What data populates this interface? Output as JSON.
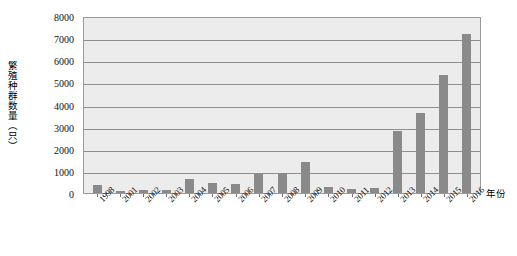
{
  "chart_data": {
    "type": "bar",
    "title": "",
    "subtitle": "",
    "xlabel": "年份",
    "ylabel": "繁殖种群数量（只）",
    "categories": [
      "1998",
      "2001",
      "2002",
      "2003",
      "2004",
      "2005",
      "2006",
      "2007",
      "2008",
      "2009",
      "2010",
      "2011",
      "2012",
      "2013",
      "2014",
      "2015",
      "2016"
    ],
    "values": [
      350,
      100,
      150,
      130,
      620,
      450,
      400,
      880,
      900,
      1400,
      250,
      200,
      230,
      2800,
      3600,
      5350,
      7200
    ],
    "series": [
      {
        "name": "繁殖种群数量",
        "values": [
          350,
          100,
          150,
          130,
          620,
          450,
          400,
          880,
          900,
          1400,
          250,
          200,
          230,
          2800,
          3600,
          5350,
          7200
        ]
      }
    ],
    "ylim": [
      0,
      8000
    ],
    "ytick_values": [
      0,
      1000,
      2000,
      3000,
      4000,
      5000,
      6000,
      7000,
      8000
    ],
    "ytick_labels": [
      "0",
      "1000",
      "2000",
      "3000",
      "4000",
      "5000",
      "6000",
      "7000",
      "8000"
    ],
    "grid": true,
    "grid_axis": "y",
    "legend": false,
    "legend_position": "none",
    "bar_color": "#8a8a8a",
    "plot_background": "#ececec",
    "grid_color": "#8f8f8f",
    "axis_color": "#9a9a9a",
    "figure_background": "#ffffff"
  }
}
